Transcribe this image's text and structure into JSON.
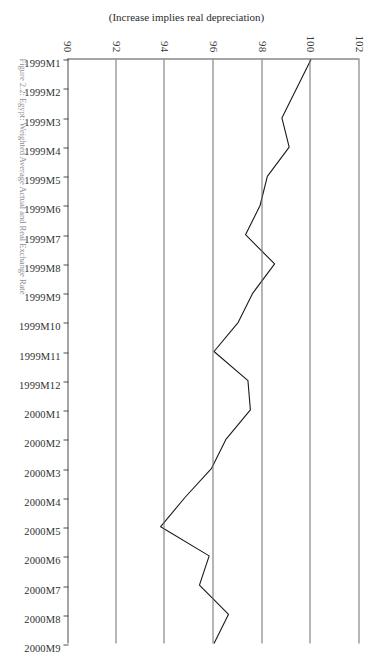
{
  "figure": {
    "caption": "Figure 2.2:  Egypt: Weighted Average Actual and Real Exchange Rate",
    "y_axis_title": "(Increase implies real depreciation)"
  },
  "chart_data": {
    "type": "line",
    "title": "",
    "subtitle": "",
    "xlabel": "",
    "ylabel": "(Increase implies real depreciation)",
    "ylim": [
      90,
      102
    ],
    "yticks": [
      90,
      92,
      94,
      96,
      98,
      100,
      102
    ],
    "grid": true,
    "legend": "none",
    "orientation": "page-rotated-180",
    "categories": [
      "1999M1",
      "1999M2",
      "1999M3",
      "1999M4",
      "1999M5",
      "1999M6",
      "1999M7",
      "1999M8",
      "1999M9",
      "1999M10",
      "1999M11",
      "1999M12",
      "2000M1",
      "2000M2",
      "2000M3",
      "2000M4",
      "2000M5",
      "2000M6",
      "2000M7",
      "2000M8",
      "2000M9"
    ],
    "values": [
      100.0,
      99.4,
      98.8,
      99.1,
      98.2,
      97.9,
      97.3,
      98.5,
      97.6,
      97.0,
      96.0,
      97.4,
      97.5,
      96.5,
      95.9,
      94.8,
      93.8,
      95.8,
      95.4,
      96.6,
      96.0
    ],
    "series": [
      {
        "name": "Real effective exchange rate index",
        "values": [
          100.0,
          99.4,
          98.8,
          99.1,
          98.2,
          97.9,
          97.3,
          98.5,
          97.6,
          97.0,
          96.0,
          97.4,
          97.5,
          96.5,
          95.9,
          94.8,
          93.8,
          95.8,
          95.4,
          96.6,
          96.0
        ],
        "color": "#1a1a1a"
      }
    ]
  }
}
